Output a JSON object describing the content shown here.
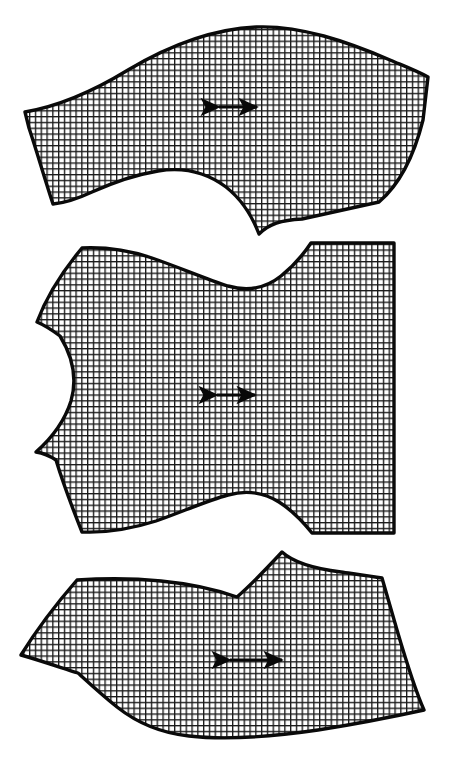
{
  "figure": {
    "canvas_width": 459,
    "canvas_height": 777,
    "background_color": "#ffffff",
    "ink_color": "#0a0a0a",
    "fill_texture": "gingham-grid",
    "grid": {
      "cell_size": 5.8,
      "line_width": 1.35,
      "line_color": "#1a1a1a",
      "cell_color": "#ffffff"
    }
  },
  "pieces": [
    {
      "id": "piece-top",
      "name": "upper-yoke-panel",
      "label": "Top pattern piece",
      "outline_path": "M 25 112 C 60 106 92 92 128 70 C 170 45 212 29 256 27 C 300 25 348 42 390 60 C 404 66 417 71 428 77 L 423 120 C 414 156 400 184 379 202 L 302 219 C 281 220 269 224 259 234 C 251 213 240 198 226 187 C 206 172 182 167 158 171 C 134 175 112 183 92 192 C 77 199 64 203 53 204 C 45 180 37 152 29 128 Z",
      "grain_arrow": {
        "x1": 214,
        "x2": 262,
        "y": 107
      }
    },
    {
      "id": "piece-middle",
      "name": "center-body-panel",
      "label": "Middle pattern piece",
      "outline_path": "M 82 248 C 104 247 128 250 152 258 C 181 268 206 279 228 286 C 249 292 266 288 281 276 C 296 264 305 252 311 243 L 394 243 L 394 533 L 312 533 C 304 523 293 511 279 502 C 263 492 246 490 228 495 C 206 501 182 512 156 521 C 131 529 105 533 82 532 C 72 507 63 483 56 460 C 50 456 43 453 36 452 C 53 437 65 420 71 401 C 77 380 73 357 60 336 C 52 330 44 325 37 322 C 46 298 62 272 82 248 Z",
      "grain_arrow": {
        "x1": 212,
        "x2": 260,
        "y": 395
      }
    },
    {
      "id": "piece-bottom",
      "name": "lower-skirt-panel",
      "label": "Bottom pattern piece",
      "outline_path": "M 77 580 C 104 578 133 578 161 581 C 192 584 217 590 237 597 C 254 582 269 566 282 552 C 295 564 317 569 341 572 C 355 574 370 576 382 578 L 397 630 C 407 664 416 692 424 710 C 392 717 356 724 318 730 C 270 737 224 740 189 736 C 160 733 136 722 117 707 C 102 695 89 683 78 673 C 62 668 42 661 21 655 C 37 629 57 603 77 580 Z",
      "grain_arrow": {
        "x1": 225,
        "x2": 287,
        "y": 660
      }
    }
  ]
}
